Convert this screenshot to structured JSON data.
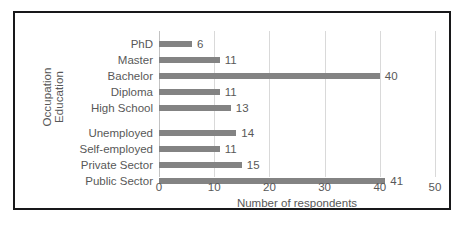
{
  "chart_data": {
    "type": "bar",
    "orientation": "horizontal",
    "title": "",
    "xlabel": "Number of respondents",
    "ylabel": "",
    "xlim": [
      0,
      50
    ],
    "xticks": [
      0,
      10,
      20,
      30,
      40,
      50
    ],
    "grid": true,
    "legend": "none",
    "bar_color": "#838383",
    "group_axis_titles": [
      "Occupation",
      "Education"
    ],
    "groups": [
      {
        "name": "Education",
        "categories": [
          "PhD",
          "Master",
          "Bachelor",
          "Diploma",
          "High School"
        ],
        "values": [
          6,
          11,
          40,
          11,
          13
        ]
      },
      {
        "name": "Occupation",
        "categories": [
          "Unemployed",
          "Self-employed",
          "Private Sector",
          "Public Sector"
        ],
        "values": [
          14,
          11,
          15,
          41
        ]
      }
    ],
    "categories": [
      "PhD",
      "Master",
      "Bachelor",
      "Diploma",
      "High School",
      "Unemployed",
      "Self-employed",
      "Private Sector",
      "Public Sector"
    ],
    "values": [
      6,
      11,
      40,
      11,
      13,
      14,
      11,
      15,
      41
    ],
    "data_labels": [
      "6",
      "11",
      "40",
      "11",
      "13",
      "14",
      "11",
      "15",
      "41"
    ]
  },
  "axis": {
    "occupation_title": "Occupation",
    "education_title": "Education",
    "x_title": "Number of respondents",
    "ticks": [
      {
        "label": "0",
        "value": 0
      },
      {
        "label": "10",
        "value": 10
      },
      {
        "label": "20",
        "value": 20
      },
      {
        "label": "30",
        "value": 30
      },
      {
        "label": "40",
        "value": 40
      },
      {
        "label": "50",
        "value": 50
      }
    ]
  },
  "rows": [
    {
      "label": "PhD",
      "value": 6,
      "display": "6",
      "top": 6
    },
    {
      "label": "Master",
      "value": 11,
      "display": "11",
      "top": 22
    },
    {
      "label": "Bachelor",
      "value": 40,
      "display": "40",
      "top": 38
    },
    {
      "label": "Diploma",
      "value": 11,
      "display": "11",
      "top": 54
    },
    {
      "label": "High School",
      "value": 13,
      "display": "13",
      "top": 70
    },
    {
      "label": "Unemployed",
      "value": 14,
      "display": "14",
      "top": 95
    },
    {
      "label": "Self-employed",
      "value": 11,
      "display": "11",
      "top": 111
    },
    {
      "label": "Private Sector",
      "value": 15,
      "display": "15",
      "top": 127
    },
    {
      "label": "Public Sector",
      "value": 41,
      "display": "41",
      "top": 143
    }
  ],
  "colors": {
    "bar": "#838383",
    "frame": "#18181a",
    "grid": "#d9d9d9",
    "text": "#585858",
    "background": "#ffffff"
  }
}
